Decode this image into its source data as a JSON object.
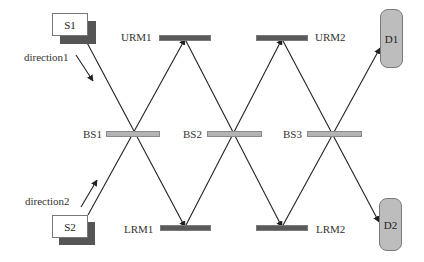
{
  "diagram": {
    "title": "",
    "sources": [
      {
        "id": "s1",
        "label": "S1"
      },
      {
        "id": "s2",
        "label": "S2"
      }
    ],
    "direction_labels": {
      "direction1": "direction1",
      "direction2": "direction2"
    },
    "upper_mirrors": [
      {
        "id": "urm1",
        "label": "URM1"
      },
      {
        "id": "urm2",
        "label": "URM2"
      }
    ],
    "lower_mirrors": [
      {
        "id": "lrm1",
        "label": "LRM1"
      },
      {
        "id": "lrm2",
        "label": "LRM2"
      }
    ],
    "beam_splitters": [
      {
        "id": "bs1",
        "label": "BS1"
      },
      {
        "id": "bs2",
        "label": "BS2"
      },
      {
        "id": "bs3",
        "label": "BS3"
      }
    ],
    "detectors": [
      {
        "id": "d1",
        "label": "D1"
      },
      {
        "id": "d2",
        "label": "D2"
      }
    ],
    "edges": [
      {
        "from": "S1",
        "to": "BS1"
      },
      {
        "from": "BS1",
        "to": "LRM1"
      },
      {
        "from": "S2",
        "to": "BS1"
      },
      {
        "from": "BS1",
        "to": "URM1"
      },
      {
        "from": "URM1",
        "to": "BS2"
      },
      {
        "from": "BS2",
        "to": "LRM2"
      },
      {
        "from": "LRM1",
        "to": "BS2"
      },
      {
        "from": "BS2",
        "to": "URM2"
      },
      {
        "from": "URM2",
        "to": "BS3"
      },
      {
        "from": "BS3",
        "to": "D2"
      },
      {
        "from": "LRM2",
        "to": "BS3"
      },
      {
        "from": "BS3",
        "to": "D1"
      }
    ],
    "colors": {
      "beam": "#222222",
      "mirror": "#5a5a5a",
      "splitter": "#b4b4b4",
      "detector": "#bdbdbd",
      "source_shadow": "#555555"
    }
  }
}
